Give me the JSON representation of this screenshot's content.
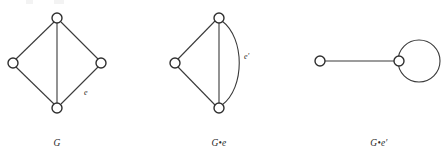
{
  "figure": {
    "kind": "graph-theory-diagram",
    "background_color": "#ffffff",
    "stroke_color": "#3a3a3a",
    "vertex_fill": "#ffffff",
    "vertex_stroke": "#2f2f2f",
    "width": 445,
    "height": 158
  },
  "panels": [
    {
      "id": "panel-g",
      "caption": "G",
      "vertices": [
        {
          "name": "top",
          "cx": 57,
          "cy": 18,
          "r": 5
        },
        {
          "name": "left",
          "cx": 13,
          "cy": 63,
          "r": 5
        },
        {
          "name": "right",
          "cx": 101,
          "cy": 63,
          "r": 5
        },
        {
          "name": "bottom",
          "cx": 57,
          "cy": 108,
          "r": 5
        }
      ],
      "edges": [
        {
          "name": "top-left",
          "from": "top",
          "to": "left",
          "shape": "straight"
        },
        {
          "name": "top-right",
          "from": "top",
          "to": "right",
          "shape": "straight"
        },
        {
          "name": "top-bottom",
          "from": "top",
          "to": "bottom",
          "shape": "straight"
        },
        {
          "name": "left-bottom",
          "from": "left",
          "to": "bottom",
          "shape": "straight"
        },
        {
          "name": "right-bottom",
          "from": "right",
          "to": "bottom",
          "shape": "straight",
          "label": "e"
        }
      ],
      "edge_label": {
        "text": "e",
        "x": 84,
        "y": 95
      },
      "caption_pos": {
        "x": 57,
        "y": 146
      }
    },
    {
      "id": "panel-g-dot-e",
      "caption": "G•e",
      "vertices": [
        {
          "name": "top",
          "cx": 219,
          "cy": 18,
          "r": 5
        },
        {
          "name": "left",
          "cx": 175,
          "cy": 63,
          "r": 5
        },
        {
          "name": "bottom",
          "cx": 219,
          "cy": 108,
          "r": 5
        }
      ],
      "edges": [
        {
          "name": "top-left",
          "from": "top",
          "to": "left",
          "shape": "straight"
        },
        {
          "name": "left-bottom",
          "from": "left",
          "to": "bottom",
          "shape": "straight"
        },
        {
          "name": "top-bottom-straight",
          "from": "top",
          "to": "bottom",
          "shape": "straight"
        },
        {
          "name": "top-bottom-arc",
          "from": "top",
          "to": "bottom",
          "shape": "arc-right",
          "label": "e'"
        }
      ],
      "edge_label": {
        "text": "e′",
        "x": 244,
        "y": 59
      },
      "caption_pos": {
        "x": 219,
        "y": 146
      }
    },
    {
      "id": "panel-g-dot-e-prime",
      "caption": "G•e′",
      "vertices": [
        {
          "name": "left",
          "cx": 320,
          "cy": 61,
          "r": 5
        },
        {
          "name": "right",
          "cx": 399,
          "cy": 61,
          "r": 5
        }
      ],
      "edges": [
        {
          "name": "left-right",
          "from": "left",
          "to": "right",
          "shape": "straight"
        },
        {
          "name": "self-loop",
          "from": "right",
          "to": "right",
          "shape": "loop",
          "loop_center": {
            "cx": 419,
            "cy": 61
          },
          "loop_radius": 21
        }
      ],
      "caption_pos": {
        "x": 379,
        "y": 146
      }
    }
  ]
}
